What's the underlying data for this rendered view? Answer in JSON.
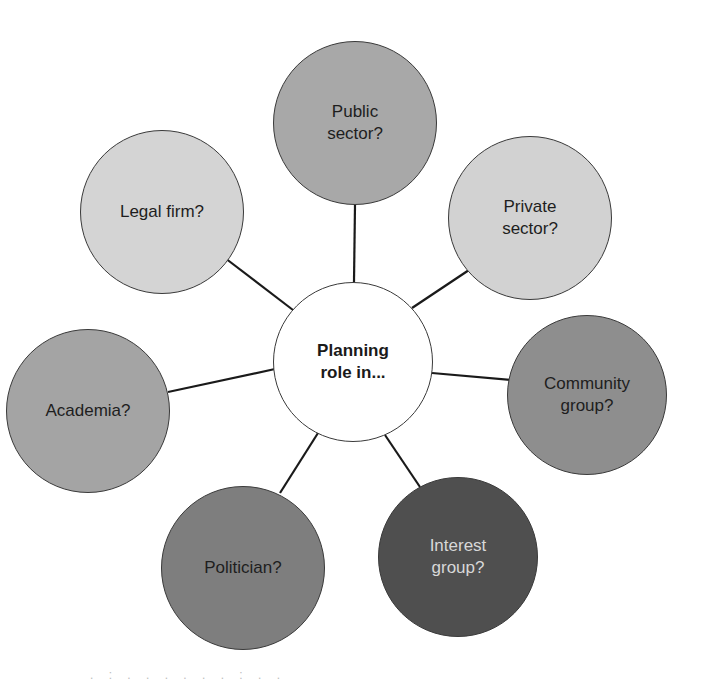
{
  "diagram": {
    "center": {
      "label": "Planning\nrole in...",
      "cx": 353,
      "cy": 362,
      "r": 80,
      "fill": "#ffffff"
    },
    "nodes": [
      {
        "id": "public-sector",
        "label": "Public\nsector?",
        "cx": 355,
        "cy": 123,
        "r": 82,
        "fill": "#a8a8a8",
        "text_color": "#1e1e1e"
      },
      {
        "id": "private-sector",
        "label": "Private\nsector?",
        "cx": 530,
        "cy": 218,
        "r": 82,
        "fill": "#d2d2d2",
        "text_color": "#1e1e1e"
      },
      {
        "id": "community-group",
        "label": "Community\ngroup?",
        "cx": 587,
        "cy": 395,
        "r": 80,
        "fill": "#8e8e8e",
        "text_color": "#1e1e1e"
      },
      {
        "id": "interest-group",
        "label": "Interest\ngroup?",
        "cx": 458,
        "cy": 557,
        "r": 80,
        "fill": "#4f4f4f",
        "text_color": "#d8d8d8"
      },
      {
        "id": "politician",
        "label": "Politician?",
        "cx": 243,
        "cy": 568,
        "r": 82,
        "fill": "#7e7e7e",
        "text_color": "#1e1e1e"
      },
      {
        "id": "academia",
        "label": "Academia?",
        "cx": 88,
        "cy": 411,
        "r": 82,
        "fill": "#a4a4a4",
        "text_color": "#1e1e1e"
      },
      {
        "id": "legal-firm",
        "label": "Legal firm?",
        "cx": 162,
        "cy": 212,
        "r": 82,
        "fill": "#d4d4d4",
        "text_color": "#1e1e1e"
      }
    ],
    "connectors": [
      {
        "x1": 355,
        "y1": 205,
        "x2": 354,
        "y2": 282
      },
      {
        "x1": 469,
        "y1": 270,
        "x2": 412,
        "y2": 308
      },
      {
        "x1": 511,
        "y1": 380,
        "x2": 432,
        "y2": 373
      },
      {
        "x1": 420,
        "y1": 487,
        "x2": 385,
        "y2": 435
      },
      {
        "x1": 280,
        "y1": 493,
        "x2": 318,
        "y2": 433
      },
      {
        "x1": 168,
        "y1": 392,
        "x2": 275,
        "y2": 369
      },
      {
        "x1": 225,
        "y1": 258,
        "x2": 293,
        "y2": 310
      }
    ],
    "line_color": "#1a1a1a"
  },
  "footer": {
    "fragment": ". : . . . . . . : . ."
  }
}
